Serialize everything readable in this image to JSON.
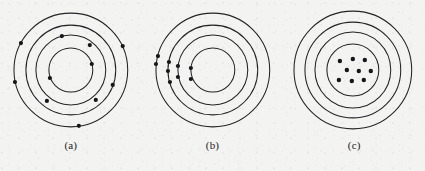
{
  "figure": {
    "background_color": "#f3f3f1",
    "stroke_color": "#232327",
    "dot_color": "#16161a",
    "panel_count": 3
  },
  "panels": [
    {
      "id": "a",
      "label": "(a)",
      "description": "electrons distributed uniformly around all four shells",
      "center": {
        "x": 71,
        "y": 70
      },
      "rings": [
        {
          "index": 1,
          "radius": 22
        },
        {
          "index": 2,
          "radius": 35
        },
        {
          "index": 3,
          "radius": 45
        },
        {
          "index": 4,
          "radius": 57
        }
      ],
      "dot_radius": 2.1,
      "dot_count": 11,
      "dots": [
        {
          "ring": 2,
          "angle_deg": 255,
          "x": 62,
          "y": 36
        },
        {
          "ring": 3,
          "angle_deg": 295,
          "x": 90,
          "y": 45
        },
        {
          "ring": 4,
          "angle_deg": 208,
          "x": 21,
          "y": 43
        },
        {
          "ring": 4,
          "angle_deg": 335,
          "x": 123,
          "y": 46
        },
        {
          "ring": 1,
          "angle_deg": 345,
          "x": 92,
          "y": 64
        },
        {
          "ring": 4,
          "angle_deg": 168,
          "x": 15,
          "y": 82
        },
        {
          "ring": 1,
          "angle_deg": 160,
          "x": 50,
          "y": 78
        },
        {
          "ring": 3,
          "angle_deg": 20,
          "x": 113,
          "y": 85
        },
        {
          "ring": 2,
          "angle_deg": 115,
          "x": 47,
          "y": 101
        },
        {
          "ring": 2,
          "angle_deg": 60,
          "x": 96,
          "y": 100
        },
        {
          "ring": 4,
          "angle_deg": 82,
          "x": 79,
          "y": 126
        }
      ]
    },
    {
      "id": "b",
      "label": "(b)",
      "description": "electrons bunched together on the left-hand side of the shells",
      "center": {
        "x": 71,
        "y": 70
      },
      "rings": [
        {
          "index": 1,
          "radius": 22
        },
        {
          "index": 2,
          "radius": 35
        },
        {
          "index": 3,
          "radius": 45
        },
        {
          "index": 4,
          "radius": 57
        }
      ],
      "dot_radius": 2.1,
      "dot_count": 9,
      "dots": [
        {
          "ring": 4,
          "angle_deg": 194,
          "x": 16,
          "y": 56
        },
        {
          "ring": 4,
          "angle_deg": 186,
          "x": 14,
          "y": 64
        },
        {
          "ring": 3,
          "angle_deg": 190,
          "x": 27,
          "y": 62
        },
        {
          "ring": 3,
          "angle_deg": 181,
          "x": 26,
          "y": 71
        },
        {
          "ring": 2,
          "angle_deg": 186,
          "x": 36,
          "y": 66
        },
        {
          "ring": 2,
          "angle_deg": 176,
          "x": 36,
          "y": 77
        },
        {
          "ring": 1,
          "angle_deg": 183,
          "x": 49,
          "y": 68
        },
        {
          "ring": 1,
          "angle_deg": 172,
          "x": 49,
          "y": 79
        },
        {
          "ring": 3,
          "angle_deg": 168,
          "x": 28,
          "y": 82
        }
      ]
    },
    {
      "id": "c",
      "label": "(c)",
      "description": "electrons collapsed into a cluster at the centre of the innermost shell",
      "center": {
        "x": 70,
        "y": 70
      },
      "rings": [
        {
          "index": 1,
          "radius": 26
        },
        {
          "index": 2,
          "radius": 38
        },
        {
          "index": 3,
          "radius": 48
        },
        {
          "index": 4,
          "radius": 59
        }
      ],
      "dot_radius": 2.2,
      "dot_count": 9,
      "dots": [
        {
          "ring": 0,
          "x": 57,
          "y": 61
        },
        {
          "ring": 0,
          "x": 70,
          "y": 59
        },
        {
          "ring": 0,
          "x": 82,
          "y": 60
        },
        {
          "ring": 0,
          "x": 64,
          "y": 70
        },
        {
          "ring": 0,
          "x": 76,
          "y": 71
        },
        {
          "ring": 0,
          "x": 88,
          "y": 71
        },
        {
          "ring": 0,
          "x": 56,
          "y": 80
        },
        {
          "ring": 0,
          "x": 69,
          "y": 81
        },
        {
          "ring": 0,
          "x": 81,
          "y": 80
        }
      ]
    }
  ]
}
